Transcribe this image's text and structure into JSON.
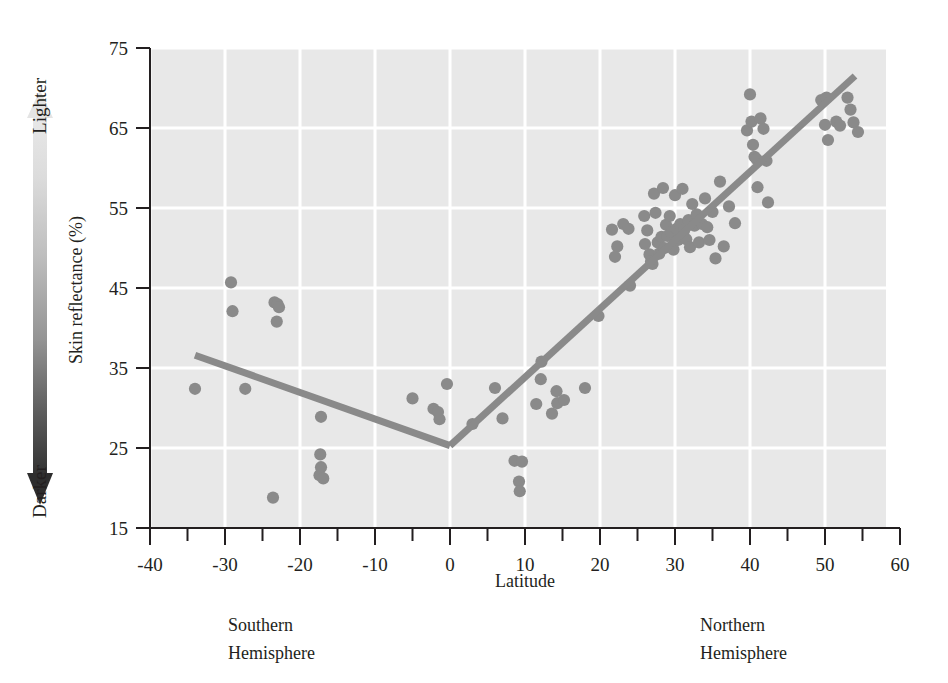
{
  "chart_data": {
    "type": "scatter",
    "title": "",
    "xlabel": "Latitude",
    "ylabel": "Skin reflectance (%)",
    "xlim": [
      -40,
      60
    ],
    "ylim": [
      15,
      75
    ],
    "xticks": [
      -40,
      -30,
      -20,
      -10,
      0,
      10,
      20,
      30,
      40,
      50,
      60
    ],
    "xtick_labels": [
      "-40",
      "-30",
      "-20",
      "-10",
      "0",
      "10",
      "20",
      "30",
      "40",
      "50",
      "60"
    ],
    "xminor_step": 5,
    "yticks": [
      15,
      25,
      35,
      45,
      55,
      65,
      75
    ],
    "ytick_labels": [
      "15",
      "25",
      "35",
      "45",
      "55",
      "65",
      "75"
    ],
    "grid": true,
    "grid_color": "#ffffff",
    "plot_background": "#e8e8e8",
    "point_color": "#8a8a8a",
    "line_color": "#8a8a8a",
    "points": [
      [
        -34.0,
        32.4
      ],
      [
        -29.2,
        45.7
      ],
      [
        -29.0,
        42.1
      ],
      [
        -27.3,
        32.4
      ],
      [
        -23.4,
        43.2
      ],
      [
        -23.0,
        43.0
      ],
      [
        -22.8,
        42.6
      ],
      [
        -23.1,
        40.8
      ],
      [
        -23.6,
        18.8
      ],
      [
        -17.2,
        28.9
      ],
      [
        -17.3,
        24.2
      ],
      [
        -17.2,
        22.6
      ],
      [
        -17.4,
        21.6
      ],
      [
        -16.9,
        21.2
      ],
      [
        -5.0,
        31.2
      ],
      [
        -2.2,
        29.9
      ],
      [
        -1.6,
        29.5
      ],
      [
        -1.4,
        28.6
      ],
      [
        -0.4,
        33.0
      ],
      [
        3.0,
        28.0
      ],
      [
        6.0,
        32.5
      ],
      [
        7.0,
        28.7
      ],
      [
        8.6,
        23.4
      ],
      [
        9.6,
        23.3
      ],
      [
        9.2,
        20.8
      ],
      [
        9.3,
        19.6
      ],
      [
        11.5,
        30.5
      ],
      [
        12.2,
        35.8
      ],
      [
        12.1,
        33.6
      ],
      [
        14.2,
        32.1
      ],
      [
        14.3,
        30.6
      ],
      [
        13.6,
        29.3
      ],
      [
        15.2,
        31.0
      ],
      [
        18.0,
        32.5
      ],
      [
        19.8,
        41.5
      ],
      [
        21.6,
        52.3
      ],
      [
        22.3,
        50.2
      ],
      [
        22.0,
        48.9
      ],
      [
        23.1,
        53.0
      ],
      [
        23.8,
        52.4
      ],
      [
        24.0,
        45.3
      ],
      [
        25.9,
        54.0
      ],
      [
        26.0,
        50.5
      ],
      [
        26.3,
        52.2
      ],
      [
        26.6,
        49.2
      ],
      [
        26.8,
        48.3
      ],
      [
        27.0,
        48.0
      ],
      [
        27.2,
        56.8
      ],
      [
        27.4,
        54.4
      ],
      [
        27.7,
        50.7
      ],
      [
        27.9,
        49.3
      ],
      [
        28.2,
        51.4
      ],
      [
        28.4,
        57.5
      ],
      [
        28.6,
        50.0
      ],
      [
        28.8,
        52.9
      ],
      [
        29.0,
        51.5
      ],
      [
        29.3,
        54.0
      ],
      [
        29.5,
        52.0
      ],
      [
        29.8,
        49.8
      ],
      [
        30.0,
        56.6
      ],
      [
        30.2,
        52.4
      ],
      [
        30.4,
        51.0
      ],
      [
        30.7,
        53.0
      ],
      [
        31.0,
        57.4
      ],
      [
        31.2,
        52.2
      ],
      [
        31.5,
        51.1
      ],
      [
        31.8,
        53.5
      ],
      [
        32.0,
        50.1
      ],
      [
        32.3,
        55.5
      ],
      [
        32.6,
        52.8
      ],
      [
        32.9,
        54.2
      ],
      [
        33.2,
        50.7
      ],
      [
        33.6,
        53.0
      ],
      [
        34.0,
        56.2
      ],
      [
        34.3,
        52.6
      ],
      [
        34.6,
        51.0
      ],
      [
        35.0,
        54.5
      ],
      [
        35.4,
        48.7
      ],
      [
        36.0,
        58.3
      ],
      [
        36.5,
        50.2
      ],
      [
        37.2,
        55.2
      ],
      [
        38.0,
        53.1
      ],
      [
        39.6,
        64.7
      ],
      [
        40.0,
        69.2
      ],
      [
        40.2,
        65.8
      ],
      [
        40.4,
        62.9
      ],
      [
        40.6,
        61.4
      ],
      [
        40.9,
        61.1
      ],
      [
        41.0,
        57.6
      ],
      [
        41.4,
        66.2
      ],
      [
        41.8,
        64.9
      ],
      [
        42.2,
        60.9
      ],
      [
        42.4,
        55.7
      ],
      [
        49.5,
        68.5
      ],
      [
        50.2,
        68.8
      ],
      [
        50.0,
        65.4
      ],
      [
        50.4,
        63.5
      ],
      [
        51.5,
        65.8
      ],
      [
        52.0,
        65.3
      ],
      [
        53.0,
        68.8
      ],
      [
        53.4,
        67.3
      ],
      [
        53.8,
        65.7
      ],
      [
        54.4,
        64.5
      ]
    ],
    "trend_lines": [
      {
        "name": "southern-hemisphere-trend",
        "x1": -34.0,
        "y1": 36.6,
        "x2": 0.0,
        "y2": 25.3
      },
      {
        "name": "northern-hemisphere-trend",
        "x1": 0.0,
        "y1": 25.3,
        "x2": 54.0,
        "y2": 71.5
      }
    ],
    "annotations": [
      {
        "name": "southern-hemisphere-caption",
        "text": "Southern\nHemisphere",
        "x": -30
      },
      {
        "name": "northern-hemisphere-caption",
        "text": "Northern\nHemisphere",
        "x": 30
      }
    ]
  },
  "gradient_legend": {
    "top_label": "Lighter",
    "bottom_label": "Darker",
    "light_color": "#e6e6e6",
    "dark_color": "#333333"
  },
  "captions": {
    "southern_line1": "Southern",
    "southern_line2": "Hemisphere",
    "northern_line1": "Northern",
    "northern_line2": "Hemisphere"
  },
  "axes": {
    "x_title": "Latitude",
    "y_title": "Skin reflectance (%)"
  }
}
